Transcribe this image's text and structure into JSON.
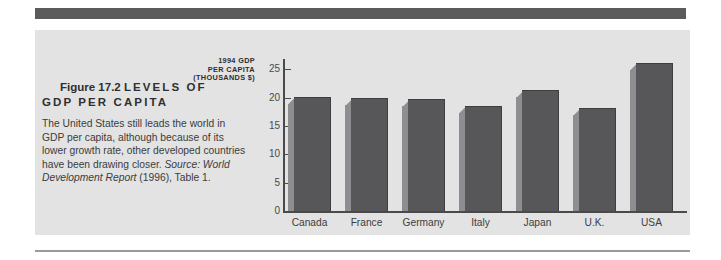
{
  "figure": {
    "number": "Figure 17.2",
    "title": "LEVELS OF GDP PER CAPITA",
    "title_line1": "LEVELS  OF",
    "title_line2": "GDP  PER  CAPITA",
    "caption_main": "The United States still leads the world in GDP per capita, although because of its lower growth rate, other developed countries have been drawing closer. ",
    "caption_source": "Source: World Development Report",
    "caption_tail": " (1996), Table 1."
  },
  "colors": {
    "panel_background": "#e3e3e3",
    "top_rule": "#5b5b5b",
    "bottom_rule": "#9a9a9a",
    "bar_face": "#575759",
    "bar_side": "#8e8e92",
    "axis": "#4a4a4a",
    "text": "#3c3c3c"
  },
  "chart_data": {
    "type": "bar",
    "title": "LEVELS OF GDP PER CAPITA",
    "ylabel": "1994 GDP PER CAPITA (THOUSANDS $)",
    "ylabel_lines": [
      "1994 GDP",
      "PER CAPITA",
      "(THOUSANDS $)"
    ],
    "xlabel": "",
    "categories": [
      "Canada",
      "France",
      "Germany",
      "Italy",
      "Japan",
      "U.K.",
      "USA"
    ],
    "values": [
      20.0,
      19.7,
      19.5,
      18.4,
      21.1,
      18.0,
      26.0
    ],
    "ylim": [
      0,
      27.5
    ],
    "yticks": [
      0,
      5,
      10,
      15,
      20,
      25
    ],
    "ytick_labels": [
      "0",
      "5",
      "10",
      "15",
      "20",
      "25"
    ],
    "grid": false,
    "legend": null,
    "style": "3d-bars"
  }
}
